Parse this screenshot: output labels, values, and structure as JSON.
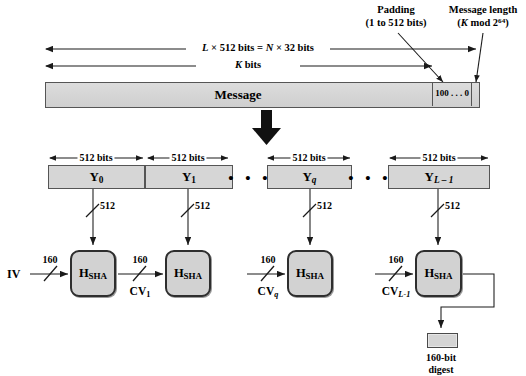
{
  "figure": {
    "title_alt": "SHA message digest generation",
    "colors": {
      "block_fill": "#d6d6d6",
      "sha_fill": "#d2d2d2",
      "stroke": "#2e2e2e",
      "background": "#ffffff"
    }
  },
  "annotations": {
    "padding_label_line1": "Padding",
    "padding_label_line2": "(1 to 512 bits)",
    "length_label_line1": "Message length",
    "length_label_line2_pre": "(",
    "length_label_K": "K",
    "length_label_mod": " mod 2",
    "length_label_exp": "64",
    "length_label_close": ")"
  },
  "dimension_lines": {
    "total_L": "L × 512 bits = N × 32 bits",
    "total_L_parts": {
      "L": "L",
      "mid": " × 512 bits = ",
      "N": "N",
      "tail": " × 32 bits"
    },
    "k_bits_parts": {
      "K": "K",
      "tail": " bits"
    }
  },
  "message_bar": {
    "label": "Message",
    "padding_cell": "100 . . . 0",
    "length_cell": ""
  },
  "blocks": {
    "size_label": "512 bits",
    "items": [
      {
        "name": "Y",
        "sub": "0",
        "id": "block-y0"
      },
      {
        "name": "Y",
        "sub": "1",
        "id": "block-y1"
      },
      {
        "name": "Y",
        "sub": "q",
        "id": "block-yq"
      },
      {
        "name": "Y",
        "sub": "L – 1",
        "id": "block-yl1"
      }
    ],
    "ellipsis": "• • •"
  },
  "rounds": {
    "input_bus_width": "512",
    "chain_bus_width": "160",
    "iv_label": "IV",
    "hash_fn_name": "H",
    "hash_fn_sub": "SHA",
    "cv_labels": [
      {
        "text": "CV",
        "sub": "1"
      },
      {
        "text": "CV",
        "sub": "q"
      },
      {
        "text": "CV",
        "sub": "L-1"
      }
    ]
  },
  "digest": {
    "label_line1": "160-bit",
    "label_line2": "digest"
  }
}
